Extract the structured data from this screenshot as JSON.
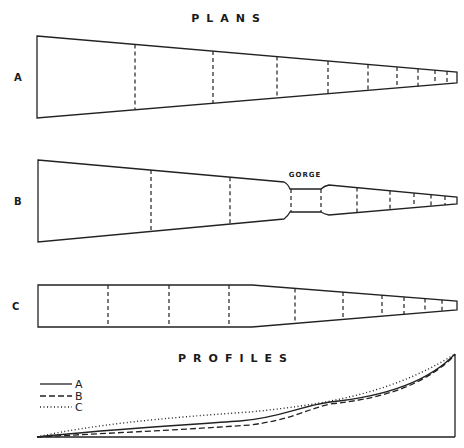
{
  "titles": {
    "plans": "PLANS",
    "profiles": "PROFILES"
  },
  "plans": [
    {
      "id": "A",
      "label": "A",
      "description": "Uniform taper from wide mouth to narrow tip",
      "dividers_x": [
        135,
        213,
        277,
        328,
        368,
        397,
        418,
        435,
        447
      ]
    },
    {
      "id": "B",
      "label": "B",
      "description": "Taper interrupted by a narrow parallel gorge section",
      "annotation": "GORGE",
      "dividers_x": [
        151,
        230,
        291,
        321,
        357,
        390,
        414,
        431,
        445
      ]
    },
    {
      "id": "C",
      "label": "C",
      "description": "Parallel-sided channel then taper to tip",
      "dividers_x": [
        108,
        169,
        229,
        295,
        343,
        382,
        404,
        425,
        442
      ]
    }
  ],
  "profiles": {
    "legend": [
      {
        "label": "A",
        "style": "solid"
      },
      {
        "label": "B",
        "style": "dashed"
      },
      {
        "label": "C",
        "style": "dotted"
      }
    ]
  },
  "colors": {
    "line": "#222222",
    "background": "#ffffff"
  }
}
